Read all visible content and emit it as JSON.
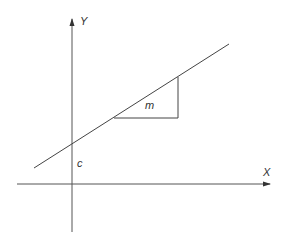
{
  "diagram": {
    "labels": {
      "y_axis": "Y",
      "x_axis": "X",
      "gradient": "m",
      "intercept": "c"
    },
    "colors": {
      "line": "#444444",
      "background": "#ffffff"
    }
  }
}
